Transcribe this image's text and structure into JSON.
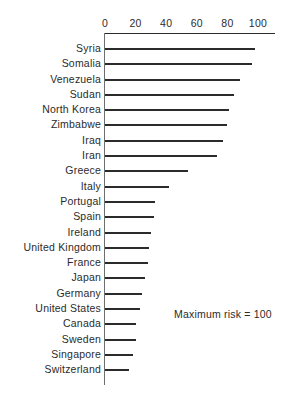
{
  "chart_data": {
    "type": "bar",
    "orientation": "horizontal",
    "title": "",
    "subtitle": "",
    "xlabel": "",
    "ylabel": "",
    "xlim": [
      0,
      100
    ],
    "xticks": [
      0,
      20,
      40,
      60,
      80,
      100
    ],
    "xtick_labels": [
      "0",
      "20",
      "40",
      "60",
      "80",
      "100"
    ],
    "grid": false,
    "legend": null,
    "annotations": [
      "Maximum risk = 100"
    ],
    "categories": [
      "Syria",
      "Somalia",
      "Venezuela",
      "Sudan",
      "North Korea",
      "Zimbabwe",
      "Iraq",
      "Iran",
      "Greece",
      "Italy",
      "Portugal",
      "Spain",
      "Ireland",
      "United Kingdom",
      "France",
      "Japan",
      "Germany",
      "United States",
      "Canada",
      "Sweden",
      "Singapore",
      "Switzerland"
    ],
    "values": [
      98,
      96,
      88,
      84,
      81,
      80,
      77,
      73,
      54,
      42,
      33,
      32,
      30,
      29,
      28,
      26,
      24,
      23,
      20,
      20,
      18,
      16
    ],
    "colors": {
      "bar": "#2b2b2b",
      "axis": "#6f6f6f",
      "text": "#2b2b2b",
      "background": "#ffffff"
    }
  },
  "annotation": {
    "maximum_risk": "Maximum risk = 100"
  }
}
